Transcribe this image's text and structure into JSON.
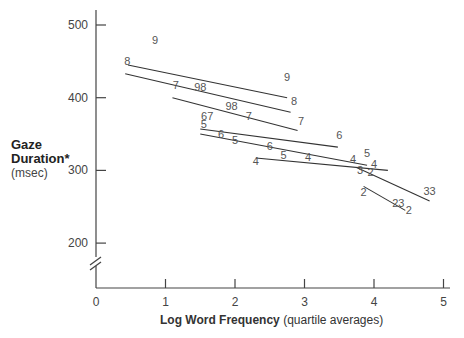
{
  "chart_data": {
    "type": "line",
    "title": "",
    "xlabel": "Log Word Frequency",
    "xlabel_suffix": "(quartile averages)",
    "ylabel": "Gaze Duration*",
    "ylabel_unit": "(msec)",
    "xlim": [
      0,
      5
    ],
    "ylim": [
      150,
      520
    ],
    "y_axis_break": true,
    "grid": false,
    "legend": "none (series labeled inline by digit)",
    "x_ticks": [
      "0",
      "1",
      "2",
      "3",
      "4",
      "5"
    ],
    "y_ticks": [
      "200",
      "300",
      "400",
      "500"
    ],
    "series": [
      {
        "name": "9",
        "x": [
          0.46,
          2.75
        ],
        "y": [
          445,
          400
        ]
      },
      {
        "name": "8",
        "x": [
          0.42,
          2.8
        ],
        "y": [
          433,
          380
        ]
      },
      {
        "name": "7",
        "x": [
          1.1,
          2.9
        ],
        "y": [
          400,
          355
        ]
      },
      {
        "name": "6",
        "x": [
          1.5,
          3.48
        ],
        "y": [
          357,
          332
        ]
      },
      {
        "name": "5",
        "x": [
          1.5,
          3.9
        ],
        "y": [
          350,
          307
        ]
      },
      {
        "name": "4",
        "x": [
          2.3,
          4.2
        ],
        "y": [
          317,
          300
        ]
      },
      {
        "name": "3",
        "x": [
          3.75,
          4.8
        ],
        "y": [
          304,
          258
        ]
      },
      {
        "name": "2",
        "x": [
          3.85,
          4.45
        ],
        "y": [
          278,
          245
        ]
      }
    ],
    "point_labels": [
      {
        "text": "9",
        "x": 0.85,
        "y": 474
      },
      {
        "text": "9",
        "x": 2.75,
        "y": 423
      },
      {
        "text": "8",
        "x": 0.45,
        "y": 445
      },
      {
        "text": "8",
        "x": 2.85,
        "y": 390
      },
      {
        "text": "7",
        "x": 1.15,
        "y": 412
      },
      {
        "text": "98",
        "x": 1.5,
        "y": 409
      },
      {
        "text": "7",
        "x": 2.95,
        "y": 363
      },
      {
        "text": "98",
        "x": 1.95,
        "y": 383
      },
      {
        "text": "7",
        "x": 2.2,
        "y": 370
      },
      {
        "text": "67",
        "x": 1.6,
        "y": 370
      },
      {
        "text": "5",
        "x": 1.55,
        "y": 358
      },
      {
        "text": "6",
        "x": 1.8,
        "y": 344
      },
      {
        "text": "5",
        "x": 2.0,
        "y": 337
      },
      {
        "text": "6",
        "x": 3.5,
        "y": 343
      },
      {
        "text": "6",
        "x": 2.5,
        "y": 328
      },
      {
        "text": "5",
        "x": 2.7,
        "y": 316
      },
      {
        "text": "4",
        "x": 2.3,
        "y": 307
      },
      {
        "text": "4",
        "x": 3.05,
        "y": 313
      },
      {
        "text": "4",
        "x": 3.7,
        "y": 310
      },
      {
        "text": "5",
        "x": 3.9,
        "y": 318
      },
      {
        "text": "3",
        "x": 3.8,
        "y": 295
      },
      {
        "text": "4",
        "x": 4.0,
        "y": 303
      },
      {
        "text": "2",
        "x": 3.95,
        "y": 292
      },
      {
        "text": "2",
        "x": 3.85,
        "y": 265
      },
      {
        "text": "23",
        "x": 4.35,
        "y": 249
      },
      {
        "text": "2",
        "x": 4.5,
        "y": 240
      },
      {
        "text": "33",
        "x": 4.8,
        "y": 266
      }
    ]
  },
  "labels": {
    "y_title": "Gaze Duration*",
    "y_unit": "(msec)",
    "x_title": "Log Word Frequency",
    "x_suffix": "(quartile averages)"
  }
}
